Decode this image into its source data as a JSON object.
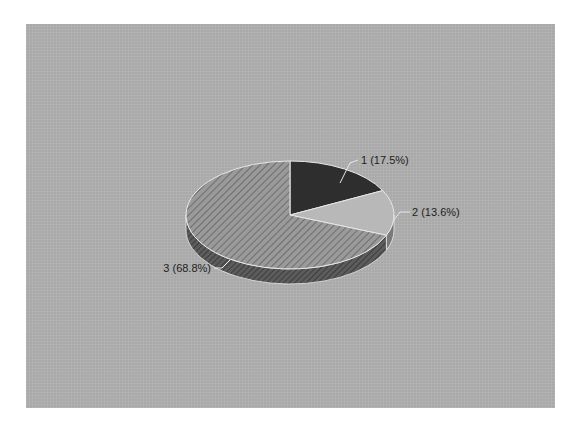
{
  "chart_data": {
    "type": "pie",
    "title": "",
    "style": "3d",
    "categories": [
      "1",
      "2",
      "3"
    ],
    "values": [
      17.5,
      13.6,
      68.8
    ],
    "labels": [
      "1 (17.5%)",
      "2 (13.6%)",
      "3 (68.8%)"
    ],
    "slice_colors": [
      "#2e2e2e",
      "#b4b4b4",
      "#8e8e8e"
    ],
    "slice_patterns": [
      "solid",
      "solid",
      "diagonal-hatch"
    ],
    "legend": "none",
    "start_angle": "12 o'clock, clockwise"
  },
  "colors": {
    "background": "#ffffff",
    "plot_area": "#a9a9a9",
    "side": "#5a5a5a",
    "outline": "#e8e8e8",
    "label_text": "#1e1e1e"
  }
}
